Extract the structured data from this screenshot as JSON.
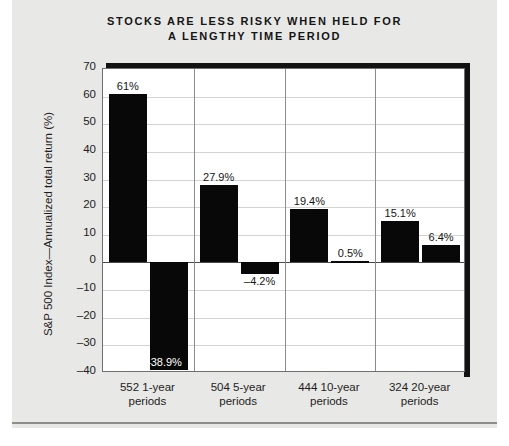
{
  "title_line1": "STOCKS ARE LESS RISKY WHEN HELD FOR",
  "title_line2": "A LENGTHY TIME PERIOD",
  "chart_data": {
    "type": "bar",
    "title": "STOCKS ARE LESS RISKY WHEN HELD FOR A LENGTHY TIME PERIOD",
    "xlabel": "",
    "ylabel": "S&P 500 Index—Annualized total return (%)",
    "ylim": [
      -40,
      70
    ],
    "yticks": [
      70,
      60,
      50,
      40,
      30,
      20,
      10,
      0,
      -10,
      -20,
      -30,
      -40
    ],
    "ytick_labels": [
      "70",
      "60",
      "50",
      "40",
      "30",
      "20",
      "10",
      "0",
      "–10",
      "–20",
      "–30",
      "–40"
    ],
    "grid": true,
    "legend": "none",
    "bar_color": "#080808",
    "plot_background": "#ffffff",
    "page_background": "#e8e8e6",
    "categories": [
      "552 1-year periods",
      "504 5-year periods",
      "444 10-year periods",
      "324 20-year periods"
    ],
    "category_lines": [
      [
        "552 1-year",
        "periods"
      ],
      [
        "504 5-year",
        "periods"
      ],
      [
        "444 10-year",
        "periods"
      ],
      [
        "324 20-year",
        "periods"
      ]
    ],
    "series": [
      {
        "name": "Best return",
        "values": [
          61.0,
          27.9,
          19.4,
          15.1
        ],
        "labels": [
          "61%",
          "27.9%",
          "19.4%",
          "15.1%"
        ]
      },
      {
        "name": "Worst return",
        "values": [
          -38.9,
          -4.2,
          0.5,
          6.4
        ],
        "labels": [
          "–38.9%",
          "–4.2%",
          "0.5%",
          "6.4%"
        ]
      }
    ]
  }
}
